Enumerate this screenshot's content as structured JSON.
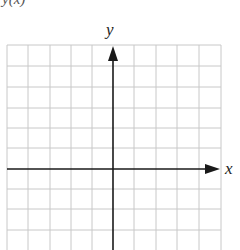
{
  "figure": {
    "top_label": "y(x)",
    "x_axis_label": "x",
    "y_axis_label": "y",
    "grid": {
      "columns": 10,
      "rows_visible": 10,
      "line_color": "#c8c8c8",
      "axis_color": "#1a1a1a"
    }
  }
}
